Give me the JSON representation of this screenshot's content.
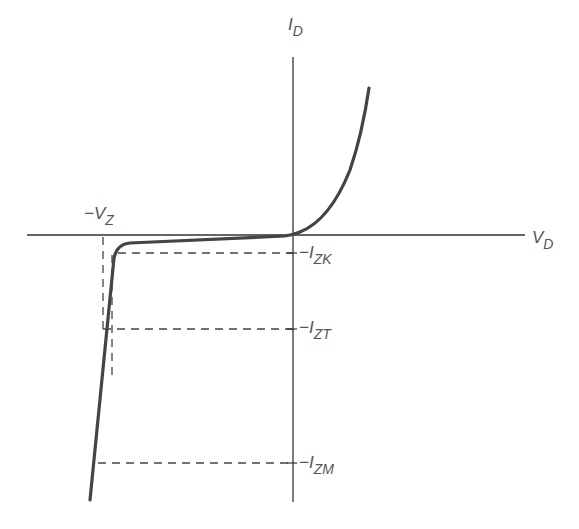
{
  "diagram": {
    "colors": {
      "axis": "#333333",
      "curve": "#444444",
      "dashed": "#444444",
      "text": "#555555",
      "background": "#ffffff"
    },
    "axes": {
      "x_label": {
        "main": "V",
        "sub": "D"
      },
      "y_label": {
        "main": "I",
        "sub": "D"
      }
    },
    "markers": {
      "vz": {
        "prefix": "−",
        "main": "V",
        "sub": "Z"
      },
      "izk": {
        "prefix": "−",
        "main": "I",
        "sub": "ZK"
      },
      "izt": {
        "prefix": "−",
        "main": "I",
        "sub": "ZT"
      },
      "izm": {
        "prefix": "−",
        "main": "I",
        "sub": "ZM"
      }
    }
  }
}
